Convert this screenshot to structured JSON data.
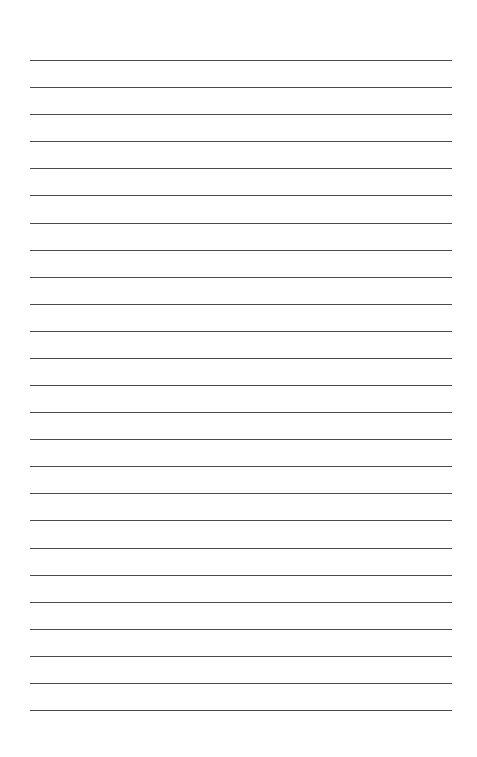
{
  "page": {
    "kind": "ruled-paper",
    "width": 477,
    "height": 757,
    "background_color": "#ffffff",
    "has_text": false,
    "has_header": false,
    "has_footer": false,
    "has_margin_rule": false,
    "title": ""
  },
  "rules": {
    "count": 25,
    "color": "#4a4a4a",
    "thickness_px": 1,
    "left_px": 30,
    "right_px": 452,
    "length_px": 422,
    "first_line_y_px": 60,
    "last_line_y_px": 710,
    "spacing_px": 27.1,
    "top_margin_px": 60,
    "bottom_margin_px": 47,
    "left_margin_px": 30,
    "right_margin_px": 25,
    "lines": [
      {
        "index": 1,
        "y": 60.0,
        "label": "line-1"
      },
      {
        "index": 2,
        "y": 87.1,
        "label": "line-2"
      },
      {
        "index": 3,
        "y": 114.2,
        "label": "line-3"
      },
      {
        "index": 4,
        "y": 141.3,
        "label": "line-4"
      },
      {
        "index": 5,
        "y": 168.3,
        "label": "line-5"
      },
      {
        "index": 6,
        "y": 195.4,
        "label": "line-6"
      },
      {
        "index": 7,
        "y": 222.5,
        "label": "line-7"
      },
      {
        "index": 8,
        "y": 249.6,
        "label": "line-8"
      },
      {
        "index": 9,
        "y": 276.7,
        "label": "line-9"
      },
      {
        "index": 10,
        "y": 303.8,
        "label": "line-10"
      },
      {
        "index": 11,
        "y": 330.8,
        "label": "line-11"
      },
      {
        "index": 12,
        "y": 357.9,
        "label": "line-12"
      },
      {
        "index": 13,
        "y": 385.0,
        "label": "line-13"
      },
      {
        "index": 14,
        "y": 412.1,
        "label": "line-14"
      },
      {
        "index": 15,
        "y": 439.2,
        "label": "line-15"
      },
      {
        "index": 16,
        "y": 466.3,
        "label": "line-16"
      },
      {
        "index": 17,
        "y": 493.3,
        "label": "line-17"
      },
      {
        "index": 18,
        "y": 520.4,
        "label": "line-18"
      },
      {
        "index": 19,
        "y": 547.5,
        "label": "line-19"
      },
      {
        "index": 20,
        "y": 574.6,
        "label": "line-20"
      },
      {
        "index": 21,
        "y": 601.7,
        "label": "line-21"
      },
      {
        "index": 22,
        "y": 628.8,
        "label": "line-22"
      },
      {
        "index": 23,
        "y": 655.8,
        "label": "line-23"
      },
      {
        "index": 24,
        "y": 682.9,
        "label": "line-24"
      },
      {
        "index": 25,
        "y": 710.0,
        "label": "line-25"
      }
    ]
  }
}
